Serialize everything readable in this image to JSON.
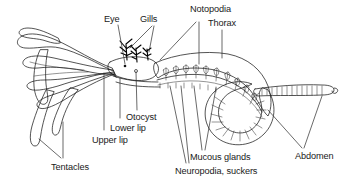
{
  "figure": {
    "background_color": "#ffffff",
    "ink_color": "#1b1b1b",
    "text_color": "#1a1a1a",
    "width": 344,
    "height": 182
  },
  "labels": {
    "eye": "Eye",
    "gills": "Gills",
    "notopodia": "Notopodia",
    "thorax": "Thorax",
    "otocyst": "Otocyst",
    "lower_lip": "Lower lip",
    "upper_lip": "Upper lip",
    "tentacles": "Tentacles",
    "neuropodia_suckers": "Neuropodia, suckers",
    "mucous_glands": "Mucous glands",
    "abdomen": "Abdomen"
  },
  "parts": [
    {
      "name": "eye",
      "label": "Eye"
    },
    {
      "name": "gills",
      "label": "Gills"
    },
    {
      "name": "notopodia",
      "label": "Notopodia"
    },
    {
      "name": "thorax",
      "label": "Thorax"
    },
    {
      "name": "otocyst",
      "label": "Otocyst"
    },
    {
      "name": "lower-lip",
      "label": "Lower lip"
    },
    {
      "name": "upper-lip",
      "label": "Upper lip"
    },
    {
      "name": "tentacles",
      "label": "Tentacles"
    },
    {
      "name": "neuropodia-suckers",
      "label": "Neuropodia, suckers"
    },
    {
      "name": "mucous-glands",
      "label": "Mucous glands"
    },
    {
      "name": "abdomen",
      "label": "Abdomen"
    }
  ]
}
